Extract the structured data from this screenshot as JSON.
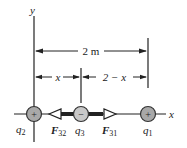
{
  "diagram": {
    "axes": {
      "y_label": "y",
      "x_label": "x"
    },
    "dimensions": {
      "total": "2 m",
      "left_segment": "x",
      "right_segment": "2 − x"
    },
    "charges": [
      {
        "id": "q2",
        "label_base": "q",
        "label_sub": "2",
        "sign": "+",
        "position": "origin"
      },
      {
        "id": "q3",
        "label_base": "q",
        "label_sub": "3",
        "sign": "−",
        "position": "x"
      },
      {
        "id": "q1",
        "label_base": "q",
        "label_sub": "1",
        "sign": "+",
        "position": "2 m"
      }
    ],
    "forces": [
      {
        "id": "F32",
        "label_base": "F",
        "label_sub": "32",
        "direction": "left"
      },
      {
        "id": "F31",
        "label_base": "F",
        "label_sub": "31",
        "direction": "right"
      }
    ],
    "colors": {
      "line": "#222222",
      "charge_fill": "#a8a8a8",
      "charge_stroke": "#333333",
      "background": "#ffffff"
    }
  }
}
